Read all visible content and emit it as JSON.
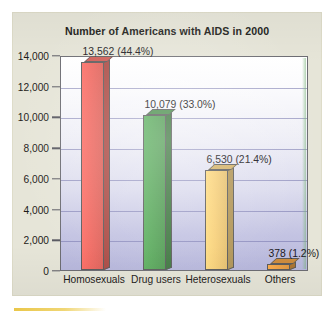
{
  "chart_data": {
    "type": "bar",
    "title": "Number of Americans with AIDS in 2000",
    "xlabel": "",
    "ylabel": "",
    "categories": [
      "Homosexuals",
      "Drug users",
      "Heterosexuals",
      "Others"
    ],
    "values": [
      13562,
      10079,
      6530,
      378
    ],
    "data_labels": [
      "13,562 (44.4%)",
      "10,079 (33.0%)",
      "6,530 (21.4%)",
      "378 (1.2%)"
    ],
    "percentages": [
      44.4,
      33.0,
      21.4,
      1.2
    ],
    "ylim": [
      0,
      14000
    ],
    "ytick_values": [
      0,
      2000,
      4000,
      6000,
      8000,
      10000,
      12000,
      14000
    ],
    "ytick_labels": [
      "0",
      "2,000",
      "4,000",
      "6,000",
      "8,000",
      "10,000",
      "12,000",
      "14,000"
    ],
    "grid": "horizontal",
    "legend": "none",
    "series": [
      {
        "name": "Number of Americans with AIDS",
        "values": [
          13562,
          10079,
          6530,
          378
        ]
      }
    ],
    "bar_colors": [
      "#ef6b63",
      "#5aa85c",
      "#f7d07a",
      "#f0a448"
    ],
    "bar_color_names": [
      "red",
      "green",
      "yellow",
      "orange"
    ],
    "style": {
      "panel_background": "#e6e5d8",
      "plot_gradient_top": "#ffffff",
      "plot_gradient_bottom": "#b8b8dd",
      "gridline_color": "#7b7bb0",
      "axis_color": "#6d6d73",
      "text_color": "#1d1a18",
      "accent_rule": "#e8c23a"
    }
  }
}
